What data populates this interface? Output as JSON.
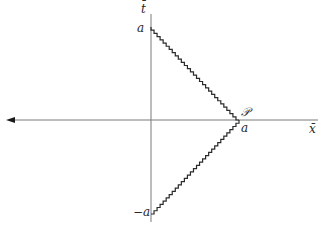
{
  "diagram": {
    "axes": {
      "horizontal_label": "x̄",
      "vertical_label": "t̄"
    },
    "labels": {
      "top": "a",
      "bottom": "−a",
      "vertex_point": "𝒫",
      "vertex_coord": "a"
    },
    "colors": {
      "axis": "#7a7a7a",
      "staircase": "#2a2a2a",
      "text": "#2a2a2a"
    },
    "geometry": {
      "origin": [
        151,
        120
      ],
      "top_point": [
        151,
        27
      ],
      "bottom_point": [
        151,
        214
      ],
      "vertex": [
        239,
        120
      ],
      "step_px": 3
    }
  }
}
